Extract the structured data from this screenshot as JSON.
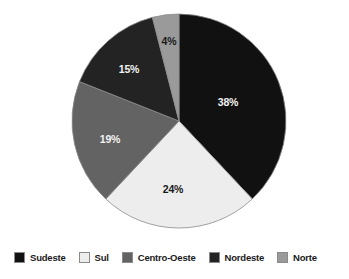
{
  "chart_data": {
    "type": "pie",
    "title": "",
    "subtitle": "",
    "xlabel": "",
    "ylabel": "",
    "grid": false,
    "legend_position": "bottom",
    "units": "percent",
    "start_angle_deg": 0,
    "direction": "clockwise",
    "categories": [
      "Sudeste",
      "Sul",
      "Centro-Oeste",
      "Nordeste",
      "Norte"
    ],
    "values": [
      38,
      24,
      19,
      15,
      4
    ],
    "data_labels": [
      "38%",
      "24%",
      "19%",
      "15%",
      "4%"
    ],
    "slices": [
      {
        "label": "Sudeste",
        "value": 38,
        "data_label": "38%",
        "color": "#111111",
        "label_color": "#f2f2f2",
        "start_deg": 0,
        "end_deg": 136.8,
        "label_x": 228,
        "label_y": 106
      },
      {
        "label": "Sul",
        "value": 24,
        "data_label": "24%",
        "color": "#ededed",
        "label_color": "#1a1a1a",
        "start_deg": 136.8,
        "end_deg": 223.2,
        "label_x": 173,
        "label_y": 193
      },
      {
        "label": "Centro-Oeste",
        "value": 19,
        "data_label": "19%",
        "color": "#636363",
        "label_color": "#f2f2f2",
        "start_deg": 223.2,
        "end_deg": 291.6,
        "label_x": 110,
        "label_y": 143
      },
      {
        "label": "Nordeste",
        "value": 15,
        "data_label": "15%",
        "color": "#232323",
        "label_color": "#f2f2f2",
        "start_deg": 291.6,
        "end_deg": 345.6,
        "label_x": 129,
        "label_y": 73
      },
      {
        "label": "Norte",
        "value": 4,
        "data_label": "4%",
        "color": "#9a9a9a",
        "label_color": "#1a1a1a",
        "start_deg": 345.6,
        "end_deg": 360,
        "label_x": 169,
        "label_y": 45
      }
    ],
    "geometry": {
      "center_x": 179,
      "center_y": 121,
      "radius": 107
    }
  },
  "legend": {
    "items": [
      {
        "label": "Sudeste",
        "color": "#111111"
      },
      {
        "label": "Sul",
        "color": "#ededed"
      },
      {
        "label": "Centro-Oeste",
        "color": "#636363"
      },
      {
        "label": "Nordeste",
        "color": "#232323"
      },
      {
        "label": "Norte",
        "color": "#9a9a9a"
      }
    ]
  },
  "colors": {
    "background": "#ffffff",
    "outline": "#8a8a8a",
    "text": "#1a1a1a"
  }
}
